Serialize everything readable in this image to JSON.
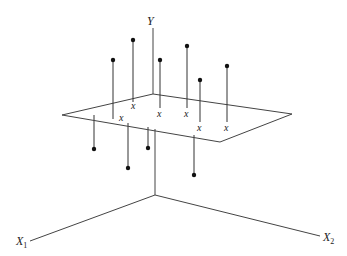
{
  "diagram": {
    "title": "",
    "axes": {
      "y": {
        "label": "Y",
        "subscript": ""
      },
      "x1": {
        "label": "X",
        "subscript": "1"
      },
      "x2": {
        "label": "X",
        "subscript": "2"
      }
    },
    "plane_marker": "x",
    "points_above": [
      {
        "id": "a1",
        "dot": [
          113,
          60
        ],
        "base": [
          113,
          119
        ]
      },
      {
        "id": "a2",
        "dot": [
          133,
          40
        ],
        "base": [
          133,
          100
        ]
      },
      {
        "id": "a3",
        "dot": [
          160,
          60
        ],
        "base": [
          160,
          106
        ]
      },
      {
        "id": "a4",
        "dot": [
          187,
          46
        ],
        "base": [
          187,
          107
        ]
      },
      {
        "id": "a5",
        "dot": [
          200,
          80
        ],
        "base": [
          200,
          121
        ]
      },
      {
        "id": "a6",
        "dot": [
          227,
          66
        ],
        "base": [
          227,
          121
        ]
      }
    ],
    "points_below": [
      {
        "id": "b1",
        "dot": [
          94,
          149
        ],
        "base": [
          94,
          115
        ]
      },
      {
        "id": "b2",
        "dot": [
          128,
          168
        ],
        "base": [
          128,
          123
        ]
      },
      {
        "id": "b3",
        "dot": [
          148,
          148
        ],
        "base": [
          148,
          127
        ]
      },
      {
        "id": "b4",
        "dot": [
          194,
          175
        ],
        "base": [
          194,
          135
        ]
      }
    ],
    "x_marks": [
      {
        "x": 134,
        "y": 109
      },
      {
        "x": 160,
        "y": 116
      },
      {
        "x": 187,
        "y": 116
      },
      {
        "x": 122,
        "y": 120
      },
      {
        "x": 200,
        "y": 131
      },
      {
        "x": 227,
        "y": 131
      }
    ],
    "colors": {
      "line": "#444444",
      "dot": "#111111",
      "background": "#ffffff"
    }
  }
}
